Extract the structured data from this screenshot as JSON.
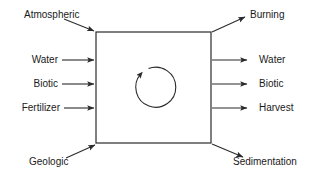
{
  "diagram": {
    "box": {
      "label": "",
      "stroke_color": "#2b2b2b"
    },
    "internal_cycle": {
      "name": "internal-cycling-arrow",
      "direction": "counterclockwise",
      "label": ""
    },
    "inputs": [
      {
        "label": "Atmospheric",
        "type": "diagonal",
        "position": "top-left"
      },
      {
        "label": "Water",
        "type": "horizontal",
        "position": "left"
      },
      {
        "label": "Biotic",
        "type": "horizontal",
        "position": "left"
      },
      {
        "label": "Fertilizer",
        "type": "horizontal",
        "position": "left"
      },
      {
        "label": "Geologic",
        "type": "diagonal",
        "position": "bottom-left"
      }
    ],
    "outputs": [
      {
        "label": "Burning",
        "type": "diagonal",
        "position": "top-right"
      },
      {
        "label": "Water",
        "type": "horizontal",
        "position": "right"
      },
      {
        "label": "Biotic",
        "type": "horizontal",
        "position": "right"
      },
      {
        "label": "Harvest",
        "type": "horizontal",
        "position": "right"
      },
      {
        "label": "Sedimentation",
        "type": "diagonal",
        "position": "bottom-right"
      }
    ]
  }
}
